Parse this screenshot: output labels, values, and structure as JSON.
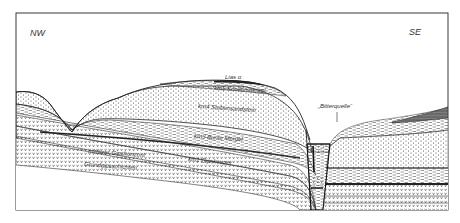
{
  "diagram": {
    "type": "geological-cross-section",
    "orientation": {
      "left": "NW",
      "right": "SE"
    },
    "labels": {
      "lias": "Lias α",
      "km5": "km5  Knollenmergel",
      "km4": "km4  Stubensandstein",
      "km3": "km3  Bunte Mergel",
      "middle_gypsum": "mittlerer  Gipshorizont",
      "km1": "km1  Gipskeuper",
      "basal_gypsum": "Grundgipsschichten",
      "spring": "„Bitterquelle“"
    },
    "layers": [
      {
        "id": "lias",
        "name": "Lias α",
        "pattern": "solid-dark"
      },
      {
        "id": "km5",
        "name": "Knollenmergel",
        "pattern": "dashes"
      },
      {
        "id": "km4",
        "name": "Stubensandstein",
        "pattern": "dots"
      },
      {
        "id": "km3",
        "name": "Bunte Mergel",
        "pattern": "dashes"
      },
      {
        "id": "km1-upper",
        "name": "Gipskeuper",
        "pattern": "v-marks"
      },
      {
        "id": "km1-middle",
        "name": "mittlerer Gipshorizont",
        "pattern": "v-marks"
      },
      {
        "id": "km1-basal",
        "name": "Grundgipsschichten",
        "pattern": "v-marks"
      }
    ],
    "colors": {
      "line": "#222222",
      "fill_dark": "#555555",
      "paper": "#ffffff"
    }
  }
}
